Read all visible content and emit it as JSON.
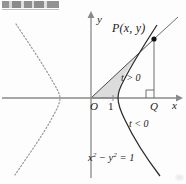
{
  "figure": {
    "equation_label": "x² − y² = 1",
    "equation_base": "x",
    "equation_exp1": "2",
    "equation_mid": " − y",
    "equation_exp2": "2",
    "equation_tail": " = 1",
    "point_label": "P(x, y)",
    "axis_x_label": "x",
    "axis_y_label": "y",
    "origin_label": "O",
    "tick_one_label": "1",
    "foot_label": "Q",
    "t_positive_label": "t > 0",
    "t_negative_label": "t < 0",
    "colors": {
      "axis": "#8a8a8a",
      "curve": "#2b2b2b",
      "dashed_curve": "#9a9a9a",
      "shade_fill": "#dcdcdc",
      "shade_stroke": "#4a4a4a",
      "text": "#1b1b1b",
      "background": "#fdfdfd"
    },
    "geometry": {
      "origin_px": [
        91,
        98
      ],
      "point_P_px": [
        154,
        39
      ],
      "point_Q_px": [
        154,
        98
      ],
      "vertex_px": [
        118,
        98
      ],
      "x_axis_y_px": 98,
      "y_axis_x_px": 91
    }
  }
}
